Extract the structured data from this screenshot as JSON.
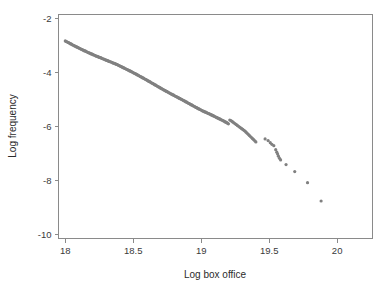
{
  "chart_data": {
    "type": "scatter",
    "title": "",
    "xlabel": "Log box office",
    "ylabel": "Log frequency",
    "xlim": [
      17.95,
      20.26
    ],
    "ylim": [
      -10.15,
      -1.85
    ],
    "xticks": [
      18,
      18.5,
      19,
      19.5,
      20
    ],
    "xticklabels": [
      "18",
      "18.5",
      "19",
      "19.5",
      "20"
    ],
    "yticks": [
      -2,
      -4,
      -6,
      -8,
      -10
    ],
    "yticklabels": [
      "-2",
      "-4",
      "-6",
      "-8",
      "-10"
    ],
    "grid": false,
    "legend": null,
    "marker_color": "#808080",
    "marker_size": 3.2,
    "frame_color": "#8a8a8a",
    "series": [
      {
        "name": "box office rank-frequency",
        "points": [
          [
            18.0,
            -2.83
          ],
          [
            18.006,
            -2.85
          ],
          [
            18.012,
            -2.86
          ],
          [
            18.018,
            -2.88
          ],
          [
            18.024,
            -2.89
          ],
          [
            18.03,
            -2.91
          ],
          [
            18.036,
            -2.93
          ],
          [
            18.042,
            -2.94
          ],
          [
            18.048,
            -2.96
          ],
          [
            18.054,
            -2.98
          ],
          [
            18.06,
            -2.99
          ],
          [
            18.066,
            -3.01
          ],
          [
            18.072,
            -3.02
          ],
          [
            18.078,
            -3.04
          ],
          [
            18.084,
            -3.05
          ],
          [
            18.09,
            -3.07
          ],
          [
            18.096,
            -3.08
          ],
          [
            18.102,
            -3.1
          ],
          [
            18.108,
            -3.11
          ],
          [
            18.114,
            -3.13
          ],
          [
            18.12,
            -3.14
          ],
          [
            18.126,
            -3.16
          ],
          [
            18.132,
            -3.17
          ],
          [
            18.138,
            -3.19
          ],
          [
            18.144,
            -3.2
          ],
          [
            18.15,
            -3.21
          ],
          [
            18.156,
            -3.23
          ],
          [
            18.162,
            -3.24
          ],
          [
            18.168,
            -3.26
          ],
          [
            18.174,
            -3.27
          ],
          [
            18.18,
            -3.28
          ],
          [
            18.186,
            -3.3
          ],
          [
            18.192,
            -3.31
          ],
          [
            18.198,
            -3.32
          ],
          [
            18.204,
            -3.34
          ],
          [
            18.21,
            -3.35
          ],
          [
            18.216,
            -3.36
          ],
          [
            18.222,
            -3.38
          ],
          [
            18.228,
            -3.39
          ],
          [
            18.234,
            -3.4
          ],
          [
            18.24,
            -3.41
          ],
          [
            18.246,
            -3.43
          ],
          [
            18.252,
            -3.44
          ],
          [
            18.258,
            -3.45
          ],
          [
            18.264,
            -3.46
          ],
          [
            18.27,
            -3.48
          ],
          [
            18.276,
            -3.49
          ],
          [
            18.282,
            -3.5
          ],
          [
            18.288,
            -3.51
          ],
          [
            18.294,
            -3.53
          ],
          [
            18.3,
            -3.54
          ],
          [
            18.306,
            -3.55
          ],
          [
            18.312,
            -3.56
          ],
          [
            18.318,
            -3.58
          ],
          [
            18.324,
            -3.59
          ],
          [
            18.33,
            -3.6
          ],
          [
            18.336,
            -3.61
          ],
          [
            18.342,
            -3.62
          ],
          [
            18.348,
            -3.64
          ],
          [
            18.354,
            -3.65
          ],
          [
            18.36,
            -3.66
          ],
          [
            18.366,
            -3.67
          ],
          [
            18.372,
            -3.69
          ],
          [
            18.378,
            -3.7
          ],
          [
            18.384,
            -3.71
          ],
          [
            18.39,
            -3.73
          ],
          [
            18.396,
            -3.74
          ],
          [
            18.402,
            -3.76
          ],
          [
            18.408,
            -3.77
          ],
          [
            18.414,
            -3.79
          ],
          [
            18.42,
            -3.8
          ],
          [
            18.426,
            -3.82
          ],
          [
            18.432,
            -3.83
          ],
          [
            18.438,
            -3.85
          ],
          [
            18.444,
            -3.86
          ],
          [
            18.45,
            -3.88
          ],
          [
            18.456,
            -3.89
          ],
          [
            18.462,
            -3.91
          ],
          [
            18.468,
            -3.92
          ],
          [
            18.474,
            -3.94
          ],
          [
            18.48,
            -3.95
          ],
          [
            18.486,
            -3.97
          ],
          [
            18.492,
            -3.98
          ],
          [
            18.498,
            -4.0
          ],
          [
            18.504,
            -4.02
          ],
          [
            18.51,
            -4.03
          ],
          [
            18.516,
            -4.05
          ],
          [
            18.522,
            -4.06
          ],
          [
            18.528,
            -4.08
          ],
          [
            18.534,
            -4.1
          ],
          [
            18.54,
            -4.11
          ],
          [
            18.546,
            -4.13
          ],
          [
            18.552,
            -4.15
          ],
          [
            18.558,
            -4.16
          ],
          [
            18.564,
            -4.18
          ],
          [
            18.57,
            -4.2
          ],
          [
            18.576,
            -4.21
          ],
          [
            18.582,
            -4.23
          ],
          [
            18.588,
            -4.25
          ],
          [
            18.594,
            -4.26
          ],
          [
            18.6,
            -4.28
          ],
          [
            18.606,
            -4.3
          ],
          [
            18.612,
            -4.32
          ],
          [
            18.618,
            -4.33
          ],
          [
            18.624,
            -4.35
          ],
          [
            18.63,
            -4.37
          ],
          [
            18.636,
            -4.39
          ],
          [
            18.642,
            -4.4
          ],
          [
            18.648,
            -4.42
          ],
          [
            18.654,
            -4.44
          ],
          [
            18.66,
            -4.46
          ],
          [
            18.666,
            -4.47
          ],
          [
            18.672,
            -4.49
          ],
          [
            18.678,
            -4.51
          ],
          [
            18.684,
            -4.53
          ],
          [
            18.69,
            -4.54
          ],
          [
            18.696,
            -4.56
          ],
          [
            18.702,
            -4.58
          ],
          [
            18.708,
            -4.6
          ],
          [
            18.714,
            -4.61
          ],
          [
            18.72,
            -4.63
          ],
          [
            18.726,
            -4.65
          ],
          [
            18.732,
            -4.66
          ],
          [
            18.738,
            -4.68
          ],
          [
            18.744,
            -4.7
          ],
          [
            18.75,
            -4.71
          ],
          [
            18.756,
            -4.73
          ],
          [
            18.762,
            -4.75
          ],
          [
            18.768,
            -4.76
          ],
          [
            18.774,
            -4.78
          ],
          [
            18.78,
            -4.8
          ],
          [
            18.786,
            -4.81
          ],
          [
            18.792,
            -4.83
          ],
          [
            18.798,
            -4.84
          ],
          [
            18.804,
            -4.86
          ],
          [
            18.81,
            -4.88
          ],
          [
            18.816,
            -4.89
          ],
          [
            18.822,
            -4.91
          ],
          [
            18.828,
            -4.92
          ],
          [
            18.834,
            -4.94
          ],
          [
            18.84,
            -4.96
          ],
          [
            18.846,
            -4.97
          ],
          [
            18.852,
            -4.99
          ],
          [
            18.858,
            -5.0
          ],
          [
            18.864,
            -5.02
          ],
          [
            18.87,
            -5.04
          ],
          [
            18.876,
            -5.05
          ],
          [
            18.882,
            -5.07
          ],
          [
            18.888,
            -5.09
          ],
          [
            18.894,
            -5.1
          ],
          [
            18.9,
            -5.12
          ],
          [
            18.906,
            -5.14
          ],
          [
            18.912,
            -5.15
          ],
          [
            18.918,
            -5.17
          ],
          [
            18.924,
            -5.19
          ],
          [
            18.93,
            -5.2
          ],
          [
            18.936,
            -5.22
          ],
          [
            18.942,
            -5.24
          ],
          [
            18.948,
            -5.25
          ],
          [
            18.954,
            -5.27
          ],
          [
            18.96,
            -5.29
          ],
          [
            18.966,
            -5.3
          ],
          [
            18.972,
            -5.32
          ],
          [
            18.978,
            -5.34
          ],
          [
            18.984,
            -5.35
          ],
          [
            18.99,
            -5.37
          ],
          [
            18.996,
            -5.38
          ],
          [
            19.002,
            -5.4
          ],
          [
            19.008,
            -5.42
          ],
          [
            19.014,
            -5.43
          ],
          [
            19.02,
            -5.44
          ],
          [
            19.026,
            -5.46
          ],
          [
            19.032,
            -5.47
          ],
          [
            19.038,
            -5.48
          ],
          [
            19.044,
            -5.5
          ],
          [
            19.05,
            -5.51
          ],
          [
            19.056,
            -5.52
          ],
          [
            19.062,
            -5.54
          ],
          [
            19.068,
            -5.55
          ],
          [
            19.074,
            -5.57
          ],
          [
            19.08,
            -5.58
          ],
          [
            19.086,
            -5.6
          ],
          [
            19.092,
            -5.61
          ],
          [
            19.098,
            -5.63
          ],
          [
            19.104,
            -5.64
          ],
          [
            19.11,
            -5.66
          ],
          [
            19.116,
            -5.67
          ],
          [
            19.122,
            -5.69
          ],
          [
            19.128,
            -5.7
          ],
          [
            19.134,
            -5.72
          ],
          [
            19.14,
            -5.73
          ],
          [
            19.146,
            -5.75
          ],
          [
            19.152,
            -5.76
          ],
          [
            19.158,
            -5.78
          ],
          [
            19.164,
            -5.79
          ],
          [
            19.17,
            -5.81
          ],
          [
            19.176,
            -5.83
          ],
          [
            19.182,
            -5.84
          ],
          [
            19.188,
            -5.86
          ],
          [
            19.194,
            -5.88
          ],
          [
            19.2,
            -5.9
          ],
          [
            19.21,
            -5.76
          ],
          [
            19.218,
            -5.78
          ],
          [
            19.226,
            -5.81
          ],
          [
            19.234,
            -5.84
          ],
          [
            19.242,
            -5.87
          ],
          [
            19.25,
            -5.9
          ],
          [
            19.258,
            -5.93
          ],
          [
            19.266,
            -5.96
          ],
          [
            19.274,
            -5.99
          ],
          [
            19.282,
            -6.02
          ],
          [
            19.29,
            -6.05
          ],
          [
            19.298,
            -6.08
          ],
          [
            19.306,
            -6.11
          ],
          [
            19.314,
            -6.14
          ],
          [
            19.322,
            -6.17
          ],
          [
            19.33,
            -6.21
          ],
          [
            19.338,
            -6.25
          ],
          [
            19.346,
            -6.29
          ],
          [
            19.354,
            -6.33
          ],
          [
            19.362,
            -6.37
          ],
          [
            19.37,
            -6.41
          ],
          [
            19.378,
            -6.45
          ],
          [
            19.386,
            -6.49
          ],
          [
            19.394,
            -6.53
          ],
          [
            19.402,
            -6.57
          ],
          [
            19.47,
            -6.46
          ],
          [
            19.492,
            -6.52
          ],
          [
            19.508,
            -6.6
          ],
          [
            19.52,
            -6.66
          ],
          [
            19.534,
            -6.71
          ],
          [
            19.548,
            -6.86
          ],
          [
            19.556,
            -6.95
          ],
          [
            19.562,
            -7.02
          ],
          [
            19.568,
            -7.1
          ],
          [
            19.576,
            -7.18
          ],
          [
            19.584,
            -7.24
          ],
          [
            19.624,
            -7.41
          ],
          [
            19.688,
            -7.67
          ],
          [
            19.782,
            -8.08
          ],
          [
            19.882,
            -8.76
          ]
        ]
      }
    ]
  }
}
